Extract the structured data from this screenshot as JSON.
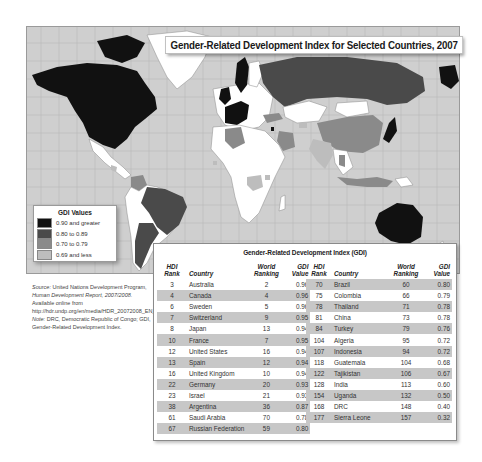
{
  "map": {
    "title": "Gender-Related Development Index for Selected Countries, 2007",
    "colors": {
      "ocean": "#cfcfcf",
      "gridline": "#b8b8b8",
      "gdi_090_plus": "#111111",
      "gdi_080_089": "#4a4a4a",
      "gdi_070_079": "#8a8a8a",
      "gdi_069_less": "#bdbdbd",
      "no_data": "#ffffff"
    }
  },
  "legend": {
    "title": "GDI Values",
    "items": [
      {
        "label": "0.90 and greater",
        "color": "#111111"
      },
      {
        "label": "0.80 to 0.89",
        "color": "#4a4a4a"
      },
      {
        "label": "0.70 to 0.79",
        "color": "#8a8a8a"
      },
      {
        "label": "0.69 and less",
        "color": "#bdbdbd"
      }
    ]
  },
  "source": {
    "label": "Source:",
    "text1": " United Nations Development Program, ",
    "report": "Human Development Report, 2007/2008.",
    "text2": " Available online from http://hdr.undp.org/en/media/HDR_20072008_EN_Complete.pdf.",
    "note_label": "Note:",
    "note_text": " DRC, Democratic Republic of Congo; GDI, Gender-Related Development Index."
  },
  "table": {
    "title": "Gender-Related Development Index (GDI)",
    "headers": {
      "hdi_rank": "HDI Rank",
      "country": "Country",
      "world_ranking": "World Ranking",
      "gdi_value_1": "GDI",
      "gdi_value_2": "Value"
    },
    "left_rows": [
      {
        "hdi": "3",
        "country": "Australia",
        "world": "2",
        "gdi": "0.96"
      },
      {
        "hdi": "4",
        "country": "Canada",
        "world": "4",
        "gdi": "0.96"
      },
      {
        "hdi": "6",
        "country": "Sweden",
        "world": "5",
        "gdi": "0.96"
      },
      {
        "hdi": "7",
        "country": "Switzerland",
        "world": "9",
        "gdi": "0.95"
      },
      {
        "hdi": "8",
        "country": "Japan",
        "world": "13",
        "gdi": "0.94"
      },
      {
        "hdi": "10",
        "country": "France",
        "world": "7",
        "gdi": "0.95"
      },
      {
        "hdi": "12",
        "country": "United States",
        "world": "16",
        "gdi": "0.94"
      },
      {
        "hdi": "13",
        "country": "Spain",
        "world": "12",
        "gdi": "0.94"
      },
      {
        "hdi": "16",
        "country": "United Kingdom",
        "world": "10",
        "gdi": "0.94"
      },
      {
        "hdi": "22",
        "country": "Germany",
        "world": "20",
        "gdi": "0.93"
      },
      {
        "hdi": "23",
        "country": "Israel",
        "world": "21",
        "gdi": "0.93"
      },
      {
        "hdi": "38",
        "country": "Argentina",
        "world": "36",
        "gdi": "0.87"
      },
      {
        "hdi": "61",
        "country": "Saudi Arabia",
        "world": "70",
        "gdi": "0.78"
      },
      {
        "hdi": "67",
        "country": "Russian Federation",
        "world": "59",
        "gdi": "0.80"
      }
    ],
    "right_rows": [
      {
        "hdi": "70",
        "country": "Brazil",
        "world": "60",
        "gdi": "0.80"
      },
      {
        "hdi": "75",
        "country": "Colombia",
        "world": "66",
        "gdi": "0.79"
      },
      {
        "hdi": "78",
        "country": "Thailand",
        "world": "71",
        "gdi": "0.78"
      },
      {
        "hdi": "81",
        "country": "China",
        "world": "73",
        "gdi": "0.78"
      },
      {
        "hdi": "84",
        "country": "Turkey",
        "world": "79",
        "gdi": "0.76"
      },
      {
        "hdi": "104",
        "country": "Algeria",
        "world": "95",
        "gdi": "0.72"
      },
      {
        "hdi": "107",
        "country": "Indonesia",
        "world": "94",
        "gdi": "0.72"
      },
      {
        "hdi": "118",
        "country": "Guatemala",
        "world": "104",
        "gdi": "0.68"
      },
      {
        "hdi": "122",
        "country": "Tajikistan",
        "world": "106",
        "gdi": "0.67"
      },
      {
        "hdi": "128",
        "country": "India",
        "world": "113",
        "gdi": "0.60"
      },
      {
        "hdi": "154",
        "country": "Uganda",
        "world": "132",
        "gdi": "0.50"
      },
      {
        "hdi": "168",
        "country": "DRC",
        "world": "148",
        "gdi": "0.40"
      },
      {
        "hdi": "177",
        "country": "Sierra Leone",
        "world": "157",
        "gdi": "0.32"
      }
    ]
  }
}
